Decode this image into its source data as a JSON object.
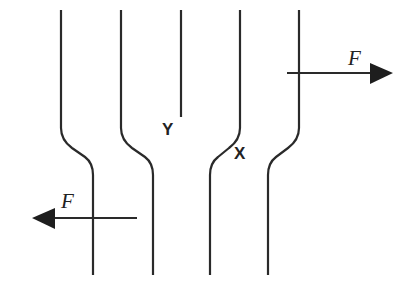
{
  "diagram": {
    "lines": [
      {
        "id": "line-1",
        "top_x": 61,
        "bottom_x": 93,
        "direction": "right"
      },
      {
        "id": "line-2",
        "top_x": 121,
        "bottom_x": 153,
        "direction": "right"
      },
      {
        "id": "line-3",
        "top_x": 181,
        "bottom_x": null,
        "direction": "none",
        "end_y": 117
      },
      {
        "id": "line-4",
        "top_x": 240,
        "bottom_x": 210,
        "direction": "left"
      },
      {
        "id": "line-5",
        "top_x": 299,
        "bottom_x": 268,
        "direction": "left"
      }
    ],
    "forces": [
      {
        "label": "F",
        "direction": "right",
        "y": 73
      },
      {
        "label": "F",
        "direction": "left",
        "y": 218
      }
    ],
    "points": {
      "x_label": "X",
      "y_label": "Y"
    },
    "colors": {
      "stroke": "#2a2a2a",
      "background": "#ffffff"
    }
  }
}
